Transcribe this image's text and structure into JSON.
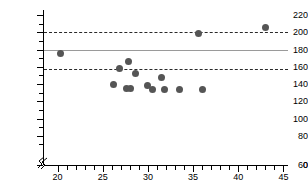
{
  "chart_data": {
    "type": "scatter",
    "title": "",
    "subtitle": "",
    "xlabel": "",
    "ylabel": "",
    "xlim": [
      18.5,
      45.5
    ],
    "ylim": [
      0,
      225
    ],
    "grid": false,
    "legend": null,
    "axis_break": {
      "axis": "y",
      "label": "0",
      "note": "broken y-axis below 60"
    },
    "y_ticks_major": [
      0,
      60,
      80,
      100,
      120,
      140,
      160,
      180,
      200,
      220
    ],
    "y_tick_labels": [
      "0",
      "60",
      "80",
      "100",
      "120",
      "140",
      "160",
      "180",
      "200",
      "220"
    ],
    "y_ticks_minor": [
      70,
      90,
      110,
      130,
      150,
      170,
      190,
      210
    ],
    "x_ticks_major": [
      20,
      25,
      30,
      35,
      40,
      45
    ],
    "x_tick_labels": [
      "20",
      "25",
      "30",
      "35",
      "40",
      "45"
    ],
    "x_ticks_minor": [
      21,
      22,
      23,
      24,
      26,
      27,
      28,
      29,
      31,
      32,
      33,
      34,
      36,
      37,
      38,
      39,
      41,
      42,
      43,
      44
    ],
    "reference_lines": [
      {
        "name": "upper-limit-of-agreement",
        "y": 200,
        "style": "dashed",
        "color": "#2a2a2a"
      },
      {
        "name": "mean-line",
        "y": 180,
        "style": "solid",
        "color": "#9a9a9a"
      },
      {
        "name": "lower-limit-of-agreement",
        "y": 157,
        "style": "dashed",
        "color": "#2a2a2a"
      }
    ],
    "marker": {
      "shape": "circle",
      "color": "#555555",
      "size": 7
    },
    "points": [
      {
        "x": 20.3,
        "y": 175
      },
      {
        "x": 26.2,
        "y": 140
      },
      {
        "x": 26.9,
        "y": 158
      },
      {
        "x": 27.6,
        "y": 135
      },
      {
        "x": 27.9,
        "y": 166
      },
      {
        "x": 28.1,
        "y": 135
      },
      {
        "x": 28.6,
        "y": 152
      },
      {
        "x": 30.0,
        "y": 138
      },
      {
        "x": 30.5,
        "y": 134
      },
      {
        "x": 31.5,
        "y": 147
      },
      {
        "x": 31.8,
        "y": 134
      },
      {
        "x": 33.5,
        "y": 134
      },
      {
        "x": 36.0,
        "y": 134
      },
      {
        "x": 35.6,
        "y": 199
      },
      {
        "x": 43.0,
        "y": 205
      }
    ]
  }
}
